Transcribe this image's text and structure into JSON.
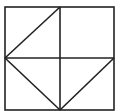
{
  "diagram": {
    "type": "geometric-figure",
    "stroke_color": "#222222",
    "background": "#ffffff",
    "square": {
      "x1": 5,
      "y1": 7,
      "x2": 114,
      "y2": 110
    },
    "lines": [
      {
        "name": "vertical-midline",
        "x1": 60,
        "y1": 7,
        "x2": 60,
        "y2": 110
      },
      {
        "name": "horizontal-midline",
        "x1": 5,
        "y1": 58,
        "x2": 114,
        "y2": 58
      },
      {
        "name": "diagonal-top-left",
        "x1": 5,
        "y1": 58,
        "x2": 60,
        "y2": 7
      },
      {
        "name": "diagonal-bottom-left",
        "x1": 5,
        "y1": 58,
        "x2": 60,
        "y2": 110
      },
      {
        "name": "diagonal-bottom-right",
        "x1": 60,
        "y1": 110,
        "x2": 114,
        "y2": 58
      }
    ]
  }
}
